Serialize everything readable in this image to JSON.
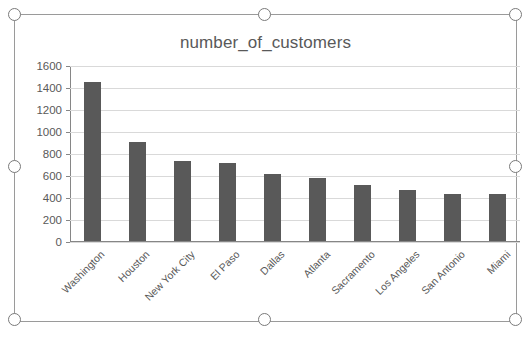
{
  "chart_object": {
    "selected": true,
    "handle_names": [
      "top-left",
      "top-center",
      "top-right",
      "middle-left",
      "middle-right",
      "bottom-left",
      "bottom-center",
      "bottom-right"
    ],
    "border_color": "#9a9a9a",
    "handle_fill": "#ffffff",
    "handle_stroke": "#7a7a7a"
  },
  "chart_data": {
    "type": "bar",
    "title": "number_of_customers",
    "xlabel": "",
    "ylabel": "",
    "categories": [
      "Washington",
      "Houston",
      "New York City",
      "El Paso",
      "Dallas",
      "Atlanta",
      "Sacramento",
      "Los Angeles",
      "San Antonio",
      "Miami"
    ],
    "values": [
      1450,
      900,
      730,
      710,
      605,
      575,
      505,
      465,
      425,
      425
    ],
    "ylim": [
      0,
      1600
    ],
    "ytick_labels": [
      "1600",
      "1400",
      "1200",
      "1000",
      "800",
      "600",
      "400",
      "200",
      "0"
    ],
    "ytick_values": [
      1600,
      1400,
      1200,
      1000,
      800,
      600,
      400,
      200,
      0
    ],
    "grid": true,
    "legend": "none",
    "bar_color": "#595959",
    "gridline_color": "#d9d9d9",
    "axis_color": "#868686",
    "text_color": "#595959"
  }
}
